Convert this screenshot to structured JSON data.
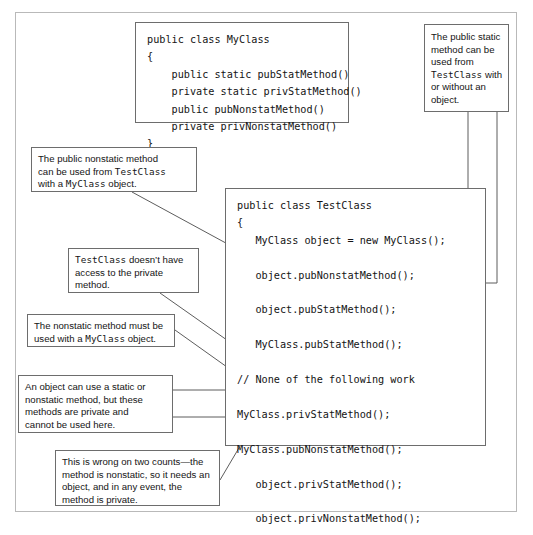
{
  "code_blocks": {
    "myclass": {
      "name": "MyClass definition",
      "lines": [
        "public class MyClass",
        "{",
        "    public static pubStatMethod()",
        "    private static privStatMethod()",
        "    public pubNonstatMethod()",
        "    private privNonstatMethod()",
        "}"
      ],
      "text": "public class MyClass\n{\n    public static pubStatMethod()\n    private static privStatMethod()\n    public pubNonstatMethod()\n    private privNonstatMethod()\n}"
    },
    "testclass": {
      "name": "TestClass definition",
      "lines": [
        "public class TestClass",
        "{",
        "   MyClass object = new MyClass();",
        "",
        "   object.pubNonstatMethod();",
        "",
        "   object.pubStatMethod();",
        "",
        "   MyClass.pubStatMethod();",
        "",
        "// None of the following work",
        "",
        "MyClass.privStatMethod();",
        "",
        "MyClass.pubNonstatMethod();",
        "",
        "   object.privStatMethod();",
        "",
        "   object.privNonstatMethod();",
        "",
        " MyClass.privNonstatMethod();",
        "",
        "}"
      ],
      "text": "public class TestClass\n{\n   MyClass object = new MyClass();\n\n   object.pubNonstatMethod();\n\n   object.pubStatMethod();\n\n   MyClass.pubStatMethod();\n\n// None of the following work\n\nMyClass.privStatMethod();\n\nMyClass.pubNonstatMethod();\n\n   object.privStatMethod();\n\n   object.privNonstatMethod();\n\n MyClass.privNonstatMethod();\n\n}"
    }
  },
  "callouts": {
    "pubstatic": {
      "id": "public-static-callout",
      "line1": "The public static",
      "line2": "method can be",
      "line3": "used from",
      "line4_mono": "TestClass",
      "line4_tail": " with",
      "line5": "or without an",
      "line6": "object."
    },
    "pubnonstat": {
      "id": "public-nonstatic-callout",
      "line1": "The public nonstatic method",
      "line2_head": "can be used from ",
      "line2_mono": "TestClass",
      "line3_head": "with a ",
      "line3_mono": "MyClass",
      "line3_tail": " object."
    },
    "noaccess": {
      "id": "no-private-access-callout",
      "line1_mono": "TestClass",
      "line1_tail": " doesn’t have",
      "line2": "access to the private",
      "line3": "method."
    },
    "nonstatic": {
      "id": "nonstatic-needs-object-callout",
      "line1": "The nonstatic method must be",
      "line2_head": "used with a ",
      "line2_mono": "MyClass",
      "line2_tail": " object."
    },
    "objectuse": {
      "id": "private-methods-callout",
      "line1": "An object can use a static or",
      "line2": "nonstatic method, but these",
      "line3": "methods are private and",
      "line4": "cannot be used here."
    },
    "wrongtwo": {
      "id": "wrong-on-two-counts-callout",
      "line1": "This is wrong on two counts—the",
      "line2": "method is nonstatic, so it needs an",
      "line3": "object, and in any event, the",
      "line4": "method is private."
    }
  },
  "colors": {
    "outer_frame": "#b9b9b9",
    "box_border": "#6d6d6d",
    "connector": "#5d5d5d",
    "text": "#141414",
    "background": "#ffffff"
  }
}
